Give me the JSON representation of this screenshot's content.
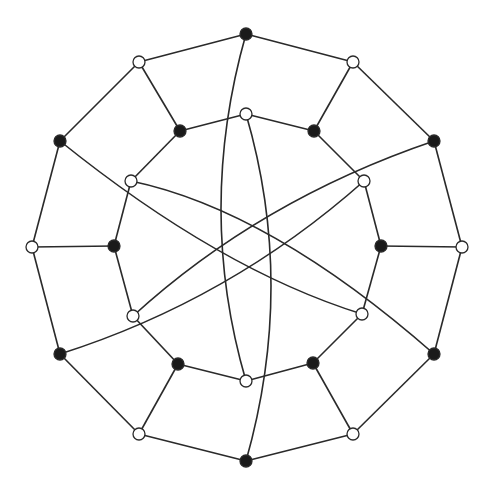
{
  "diagram": {
    "type": "graph",
    "width": 488,
    "height": 486,
    "colors": {
      "background": "#ffffff",
      "edge": "#2a2a2a",
      "node_black_fill": "#1a1a1a",
      "node_white_fill": "#ffffff",
      "node_stroke": "#2a2a2a"
    },
    "node_radius": 6,
    "nodes": [
      {
        "id": "o0",
        "x": 246,
        "y": 34,
        "fill": "black"
      },
      {
        "id": "o1",
        "x": 353,
        "y": 62,
        "fill": "white"
      },
      {
        "id": "o2",
        "x": 434,
        "y": 141,
        "fill": "black"
      },
      {
        "id": "o3",
        "x": 462,
        "y": 247,
        "fill": "white"
      },
      {
        "id": "o4",
        "x": 434,
        "y": 354,
        "fill": "black"
      },
      {
        "id": "o5",
        "x": 353,
        "y": 434,
        "fill": "white"
      },
      {
        "id": "o6",
        "x": 246,
        "y": 461,
        "fill": "black"
      },
      {
        "id": "o7",
        "x": 139,
        "y": 434,
        "fill": "white"
      },
      {
        "id": "o8",
        "x": 60,
        "y": 354,
        "fill": "black"
      },
      {
        "id": "o9",
        "x": 32,
        "y": 247,
        "fill": "white"
      },
      {
        "id": "o10",
        "x": 60,
        "y": 141,
        "fill": "black"
      },
      {
        "id": "o11",
        "x": 139,
        "y": 62,
        "fill": "white"
      },
      {
        "id": "i0",
        "x": 246,
        "y": 114,
        "fill": "white"
      },
      {
        "id": "i1",
        "x": 314,
        "y": 131,
        "fill": "black"
      },
      {
        "id": "i2",
        "x": 364,
        "y": 181,
        "fill": "white"
      },
      {
        "id": "i3",
        "x": 381,
        "y": 246,
        "fill": "black"
      },
      {
        "id": "i4",
        "x": 362,
        "y": 314,
        "fill": "white"
      },
      {
        "id": "i5",
        "x": 313,
        "y": 363,
        "fill": "black"
      },
      {
        "id": "i6",
        "x": 246,
        "y": 381,
        "fill": "white"
      },
      {
        "id": "i7",
        "x": 178,
        "y": 364,
        "fill": "black"
      },
      {
        "id": "i8",
        "x": 133,
        "y": 316,
        "fill": "white"
      },
      {
        "id": "i9",
        "x": 114,
        "y": 246,
        "fill": "black"
      },
      {
        "id": "i10",
        "x": 131,
        "y": 181,
        "fill": "white"
      },
      {
        "id": "i11",
        "x": 180,
        "y": 131,
        "fill": "black"
      }
    ],
    "edges": [
      {
        "from": "o0",
        "to": "o1"
      },
      {
        "from": "o1",
        "to": "o2"
      },
      {
        "from": "o2",
        "to": "o3"
      },
      {
        "from": "o3",
        "to": "o4"
      },
      {
        "from": "o4",
        "to": "o5"
      },
      {
        "from": "o5",
        "to": "o6"
      },
      {
        "from": "o6",
        "to": "o7"
      },
      {
        "from": "o7",
        "to": "o8"
      },
      {
        "from": "o8",
        "to": "o9"
      },
      {
        "from": "o9",
        "to": "o10"
      },
      {
        "from": "o10",
        "to": "o11"
      },
      {
        "from": "o11",
        "to": "o0"
      },
      {
        "from": "i0",
        "to": "i1"
      },
      {
        "from": "i1",
        "to": "i2"
      },
      {
        "from": "i2",
        "to": "i3"
      },
      {
        "from": "i3",
        "to": "i4"
      },
      {
        "from": "i4",
        "to": "i5"
      },
      {
        "from": "i5",
        "to": "i6"
      },
      {
        "from": "i6",
        "to": "i7"
      },
      {
        "from": "i7",
        "to": "i8"
      },
      {
        "from": "i8",
        "to": "i9"
      },
      {
        "from": "i9",
        "to": "i10"
      },
      {
        "from": "i10",
        "to": "i11"
      },
      {
        "from": "i11",
        "to": "i0"
      },
      {
        "from": "o11",
        "to": "i11"
      },
      {
        "from": "o1",
        "to": "i1"
      },
      {
        "from": "o3",
        "to": "i3"
      },
      {
        "from": "o5",
        "to": "i5"
      },
      {
        "from": "o7",
        "to": "i7"
      },
      {
        "from": "o9",
        "to": "i9"
      },
      {
        "from": "o0",
        "to": "i6",
        "curve": {
          "cx": 196,
          "cy": 210
        }
      },
      {
        "from": "i0",
        "to": "o6",
        "curve": {
          "cx": 296,
          "cy": 285
        }
      },
      {
        "from": "o10",
        "to": "i4",
        "curve": {
          "cx": 220,
          "cy": 270
        }
      },
      {
        "from": "o2",
        "to": "i8",
        "curve": {
          "cx": 260,
          "cy": 200
        }
      },
      {
        "from": "i10",
        "to": "o4",
        "curve": {
          "cx": 270,
          "cy": 210
        }
      },
      {
        "from": "i2",
        "to": "o8",
        "curve": {
          "cx": 230,
          "cy": 300
        }
      }
    ]
  }
}
